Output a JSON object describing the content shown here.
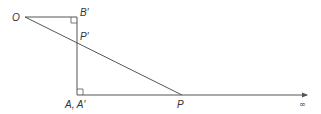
{
  "diagram": {
    "type": "geometric-construction",
    "colors": {
      "line": "#555555",
      "text": "#333333",
      "background": "#ffffff"
    },
    "labels": {
      "O": "O",
      "B_prime": "B′",
      "P_prime": "P′",
      "A_A_prime": "A, A′",
      "P": "P",
      "infinity": "∞"
    },
    "points": {
      "O": [
        25,
        17
      ],
      "B_prime": [
        77,
        17
      ],
      "P_prime": [
        77,
        43
      ],
      "A": [
        77,
        95
      ],
      "P": [
        182,
        95
      ],
      "arrow_end": [
        308,
        95
      ]
    },
    "right_angles": [
      "B_prime",
      "A"
    ]
  }
}
